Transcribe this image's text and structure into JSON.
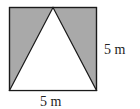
{
  "diagram": {
    "square": {
      "side": "5 m"
    },
    "labels": {
      "right_side": "5 m",
      "bottom_side": "5 m"
    },
    "colors": {
      "shade": "#a9a9a9",
      "stroke": "#1a1a1a",
      "background": "#ffffff"
    }
  }
}
